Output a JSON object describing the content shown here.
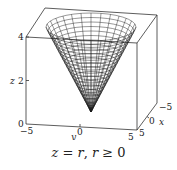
{
  "figure": {
    "type": "3d-surface-plot",
    "surface": "cone",
    "caption": {
      "lhs": "z",
      "eq": " = ",
      "rhs": "r",
      "sep": ", ",
      "cond_var": "r",
      "cond_op": " ≥ ",
      "cond_val": "0"
    },
    "axes": {
      "z": {
        "label": "z",
        "ticks": [
          "0",
          "2",
          "4"
        ]
      },
      "y": {
        "label": "y",
        "ticks": [
          "−5",
          "0",
          "5"
        ]
      },
      "x": {
        "label": "x",
        "ticks": [
          "−5",
          "0",
          "5"
        ]
      }
    },
    "colors": {
      "line": "#222222",
      "box": "#333333",
      "background": "#ffffff"
    }
  }
}
